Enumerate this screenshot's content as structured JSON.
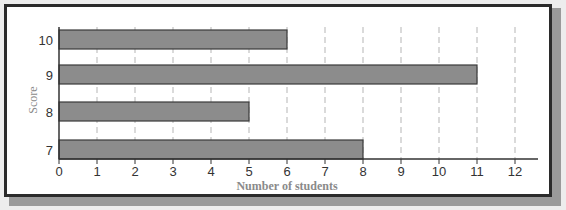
{
  "chart_data": {
    "type": "bar",
    "orientation": "horizontal",
    "title": "",
    "categories": [
      "10",
      "9",
      "8",
      "7"
    ],
    "values": [
      6,
      11,
      5,
      8
    ],
    "xlabel": "Number of students",
    "ylabel": "Score",
    "xlim": [
      0,
      12
    ],
    "xticks": [
      "0",
      "1",
      "2",
      "3",
      "4",
      "5",
      "6",
      "7",
      "8",
      "9",
      "10",
      "11",
      "12"
    ],
    "grid": "vertical dashed",
    "legend": null,
    "colors": {
      "bar": "#8c8c8c",
      "bar_edge": "#3a3a3a",
      "grid": "#b5b5b5",
      "axis": "#333333",
      "frame": "#2b2b2b"
    }
  }
}
